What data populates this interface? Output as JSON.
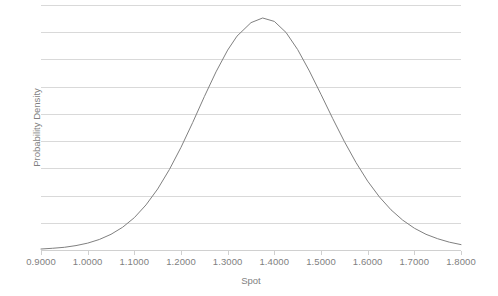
{
  "chart_data": {
    "type": "line",
    "title": "",
    "xlabel": "Spot",
    "ylabel": "Probability Density",
    "xlim": [
      0.9,
      1.8
    ],
    "ylim": [
      0,
      1.0
    ],
    "grid": true,
    "gridlines_count": 9,
    "legend": "none",
    "series": [
      {
        "name": "Probability Density",
        "color": "#808080",
        "x": [
          0.9,
          0.925,
          0.95,
          0.975,
          1.0,
          1.025,
          1.05,
          1.075,
          1.1,
          1.125,
          1.15,
          1.175,
          1.2,
          1.225,
          1.25,
          1.275,
          1.3,
          1.32,
          1.35,
          1.375,
          1.4,
          1.425,
          1.45,
          1.475,
          1.5,
          1.525,
          1.55,
          1.575,
          1.6,
          1.625,
          1.65,
          1.675,
          1.7,
          1.725,
          1.75,
          1.775,
          1.8
        ],
        "y": [
          0.004,
          0.007,
          0.011,
          0.018,
          0.028,
          0.043,
          0.064,
          0.093,
          0.132,
          0.184,
          0.249,
          0.328,
          0.419,
          0.52,
          0.626,
          0.727,
          0.816,
          0.873,
          0.928,
          0.947,
          0.933,
          0.888,
          0.818,
          0.731,
          0.635,
          0.537,
          0.443,
          0.357,
          0.281,
          0.217,
          0.164,
          0.122,
          0.089,
          0.064,
          0.046,
          0.032,
          0.022
        ]
      }
    ],
    "xticks": [
      0.9,
      1.0,
      1.1,
      1.2,
      1.3,
      1.4,
      1.5,
      1.6,
      1.7,
      1.8
    ],
    "xticklabels": [
      "0.9000",
      "1.0000",
      "1.1000",
      "1.2000",
      "1.3000",
      "1.4000",
      "1.5000",
      "1.6000",
      "1.7000",
      "1.8000"
    ],
    "yticklabels": [],
    "peak": {
      "x": 1.32,
      "label": "mode"
    },
    "colors": {
      "curve": "#808080",
      "gridline": "#d9d9d9",
      "axis": "#d0d0d0",
      "tick_text": "#7f7f7f",
      "background": "#ffffff"
    }
  }
}
